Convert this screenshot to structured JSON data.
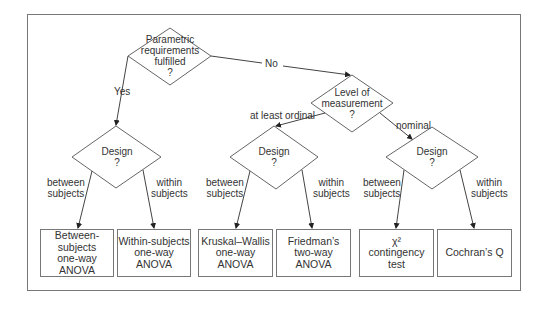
{
  "diagram": {
    "type": "decision-tree",
    "nodes": {
      "root": {
        "lines": [
          "Parametric",
          "requirements",
          "fulfilled",
          "?"
        ]
      },
      "design_param": {
        "lines": [
          "Design",
          "?"
        ]
      },
      "level": {
        "lines": [
          "Level of",
          "measurement",
          "?"
        ]
      },
      "design_ordinal": {
        "lines": [
          "Design",
          "?"
        ]
      },
      "design_nominal": {
        "lines": [
          "Design",
          "?"
        ]
      }
    },
    "edges": {
      "yes": "Yes",
      "no": "No",
      "at_least_ordinal": "at least ordinal",
      "nominal": "nominal",
      "between1": [
        "between",
        "subjects"
      ],
      "within1": [
        "within",
        "subjects"
      ],
      "between2": [
        "between",
        "subjects"
      ],
      "within2": [
        "within",
        "subjects"
      ],
      "between3": [
        "between",
        "subjects"
      ],
      "within3": [
        "within",
        "subjects"
      ]
    },
    "leaves": [
      {
        "lines": [
          "Between-subjects",
          "one-way",
          "ANOVA"
        ]
      },
      {
        "lines": [
          "Within-subjects",
          "one-way",
          "ANOVA"
        ]
      },
      {
        "lines": [
          "Kruskal–Wallis",
          "one-way",
          "ANOVA"
        ]
      },
      {
        "lines": [
          "Friedman’s",
          "two-way",
          "ANOVA"
        ]
      },
      {
        "lines": [
          "χ²",
          "contingency",
          "test"
        ]
      },
      {
        "lines": [
          "Cochran’s Q"
        ]
      }
    ]
  }
}
